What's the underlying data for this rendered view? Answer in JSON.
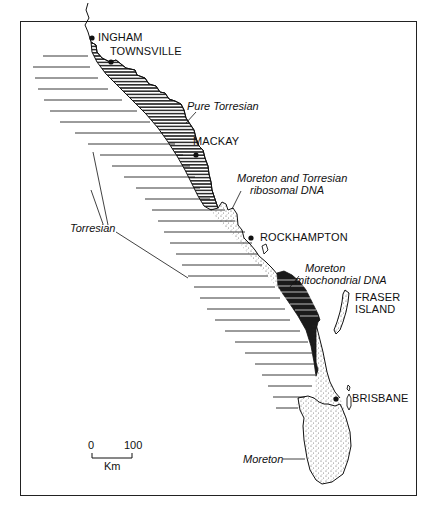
{
  "map": {
    "towns": [
      {
        "name": "INGHAM",
        "x": 92,
        "y": 38
      },
      {
        "name": "TOWNSVILLE",
        "x": 111,
        "y": 62
      },
      {
        "name": "MACKAY",
        "x": 196,
        "y": 155
      },
      {
        "name": "ROCKHAMPTON",
        "x": 251,
        "y": 237
      },
      {
        "name": "BRISBANE",
        "x": 336,
        "y": 399
      }
    ],
    "islands": [
      {
        "name_line1": "FRASER",
        "name_line2": "ISLAND"
      }
    ],
    "region_labels": {
      "pure_torresian": "Pure Torresian",
      "moreton_torresian_ribosomal_line1": "Moreton and Torresian",
      "moreton_torresian_ribosomal_line2": "ribosomal DNA",
      "torresian": "Torresian",
      "moreton_mitochondrial_line1": "Moreton",
      "moreton_mitochondrial_line2": "mitochondrial DNA",
      "moreton": "Moreton"
    },
    "scale_bar": {
      "start_label": "0",
      "end_label": "100",
      "unit": "Km"
    },
    "colors": {
      "ink": "#111111",
      "background": "#ffffff",
      "stipple": "#555555"
    }
  }
}
